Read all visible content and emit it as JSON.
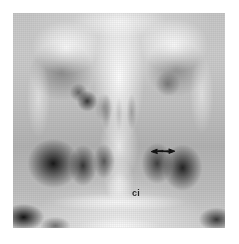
{
  "figure": {
    "kind": "radiograph",
    "modality_note": "plain skull radiograph, occipitomental / coronal projection of the paranasal sinuses",
    "canvas": {
      "width": 239,
      "height": 244,
      "background": "#ffffff"
    },
    "plate": {
      "left": 13,
      "top": 13,
      "width": 212,
      "height": 215,
      "alt": "Grayscale radiograph of the paranasal sinuses showing the orbits, nasal cavity and maxillary antra"
    }
  },
  "annotations": {
    "arrow": {
      "name": "arrow-marker",
      "glyph": "double-headed-arrow",
      "color": "#1a1a1a",
      "x": 137,
      "y": 133,
      "width": 26,
      "height": 12,
      "direction": "horizontal"
    },
    "label_ci": {
      "name": "ci-label",
      "text": "ci",
      "color": "#2a2a2a",
      "x": 119,
      "y": 176,
      "font_size_px": 9,
      "weight": "bold"
    }
  },
  "palette": {
    "page_background": "#ffffff",
    "film_light": "#efefef",
    "film_mid": "#b9b9b9",
    "film_dark": "#1a1a1a",
    "annotation_ink": "#1a1a1a"
  }
}
